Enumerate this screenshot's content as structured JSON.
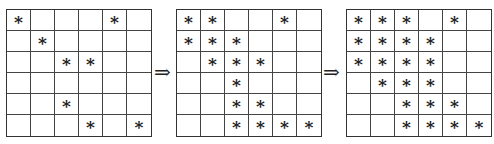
{
  "diagram": {
    "grids": [
      {
        "rows": [
          [
            "*",
            "",
            "",
            "",
            "*",
            ""
          ],
          [
            "",
            "*",
            "",
            "",
            "",
            ""
          ],
          [
            "",
            "",
            "*",
            "*",
            "",
            ""
          ],
          [
            "",
            "",
            "",
            "",
            "",
            ""
          ],
          [
            "",
            "",
            "*",
            "",
            "",
            ""
          ],
          [
            "",
            "",
            "",
            "*",
            "",
            "*"
          ]
        ]
      },
      {
        "rows": [
          [
            "*",
            "*",
            "",
            "",
            "*",
            ""
          ],
          [
            "*",
            "*",
            "*",
            "",
            "",
            ""
          ],
          [
            "",
            "*",
            "*",
            "*",
            "",
            ""
          ],
          [
            "",
            "",
            "*",
            "",
            "",
            ""
          ],
          [
            "",
            "",
            "*",
            "*",
            "",
            ""
          ],
          [
            "",
            "",
            "*",
            "*",
            "*",
            "*"
          ]
        ]
      },
      {
        "rows": [
          [
            "*",
            "*",
            "*",
            "",
            "*",
            ""
          ],
          [
            "*",
            "*",
            "*",
            "*",
            "",
            ""
          ],
          [
            "*",
            "*",
            "*",
            "*",
            "",
            ""
          ],
          [
            "",
            "*",
            "*",
            "*",
            "",
            ""
          ],
          [
            "",
            "",
            "*",
            "*",
            "*",
            ""
          ],
          [
            "",
            "",
            "*",
            "*",
            "*",
            "*"
          ]
        ]
      }
    ],
    "arrows": [
      "⇒",
      "⇒"
    ]
  }
}
